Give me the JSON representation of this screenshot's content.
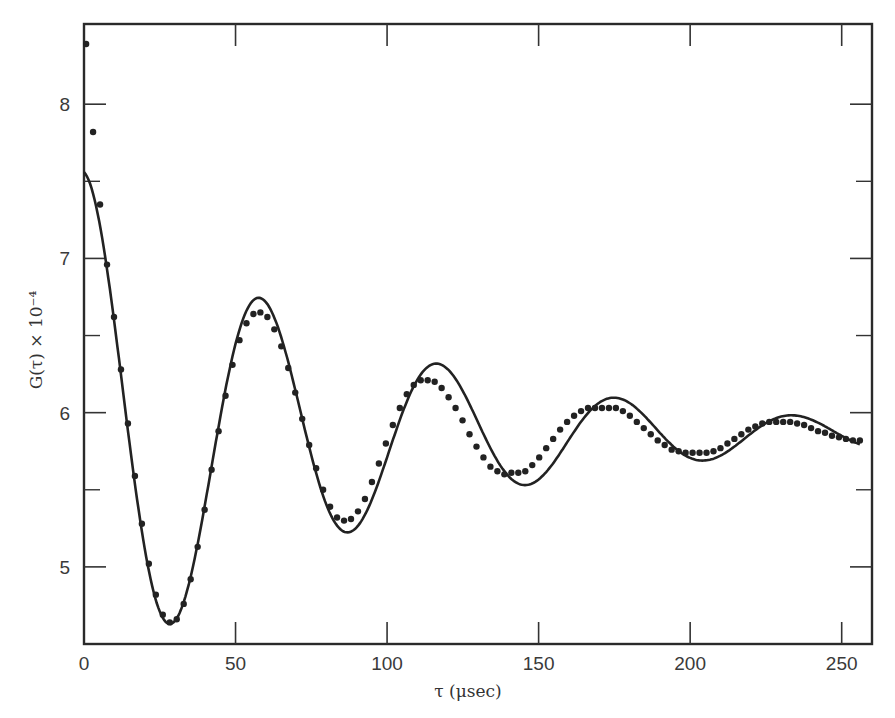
{
  "chart_data": {
    "type": "scatter",
    "title": "",
    "xlabel": "τ (μsec)",
    "ylabel": "G(τ) × 10⁻⁴",
    "xlim": [
      0,
      260
    ],
    "ylim": [
      4.5,
      8.52
    ],
    "grid": false,
    "legend": null,
    "x_ticks": [
      0,
      50,
      100,
      150,
      200,
      250
    ],
    "y_ticks": [
      5,
      6,
      7,
      8
    ],
    "y_minor_ticks": [
      4.5,
      5.5,
      6.5,
      7.5
    ],
    "outlier_points": [
      {
        "x": 0.7,
        "y": 8.39
      },
      {
        "x": 3.0,
        "y": 7.82
      },
      {
        "x": 5.3,
        "y": 7.35
      }
    ],
    "fit_curve": {
      "description": "damped cosine fit",
      "baseline": 5.86,
      "amplitude": 1.7,
      "decay_time": 89,
      "period": 58.6,
      "start": {
        "x": 0,
        "y": 7.56
      },
      "key_points": [
        {
          "x": 0,
          "y": 7.56,
          "kind": "start"
        },
        {
          "x": 28.4,
          "y": 4.63,
          "kind": "min"
        },
        {
          "x": 57.4,
          "y": 6.65,
          "kind": "max"
        },
        {
          "x": 86.8,
          "y": 5.31,
          "kind": "min"
        },
        {
          "x": 115.5,
          "y": 6.2,
          "kind": "max"
        },
        {
          "x": 145.0,
          "y": 5.61,
          "kind": "min"
        },
        {
          "x": 175.0,
          "y": 6.03,
          "kind": "max"
        },
        {
          "x": 205.6,
          "y": 5.74,
          "kind": "min"
        },
        {
          "x": 232.7,
          "y": 5.94,
          "kind": "max"
        },
        {
          "x": 256.0,
          "y": 5.82,
          "kind": "end"
        }
      ]
    },
    "series": [
      {
        "name": "measured G(τ)",
        "marker": "dot",
        "x": [
          7.6,
          9.9,
          12.2,
          14.5,
          16.8,
          19.1,
          21.4,
          23.7,
          26.0,
          28.3,
          30.6,
          32.9,
          35.2,
          37.5,
          39.8,
          42.1,
          44.4,
          46.7,
          49.0,
          51.3,
          53.6,
          55.9,
          58.2,
          60.5,
          62.8,
          65.1,
          67.4,
          69.7,
          72.0,
          74.3,
          76.6,
          78.9,
          81.2,
          83.5,
          85.8,
          88.1,
          90.4,
          92.7,
          95.0,
          97.3,
          99.6,
          101.9,
          104.2,
          106.5,
          108.8,
          111.1,
          113.4,
          115.7,
          118.0,
          120.3,
          122.6,
          124.9,
          127.2,
          129.5,
          131.8,
          134.1,
          136.4,
          138.7,
          141.0,
          143.3,
          145.6,
          147.9,
          150.2,
          152.5,
          154.8,
          157.1,
          159.4,
          161.7,
          164.0,
          166.3,
          168.6,
          170.9,
          173.2,
          175.5,
          177.8,
          180.1,
          182.4,
          184.7,
          187.0,
          189.3,
          191.6,
          193.9,
          196.2,
          198.5,
          200.8,
          203.1,
          205.4,
          207.7,
          210.0,
          212.3,
          214.6,
          216.9,
          219.2,
          221.5,
          223.8,
          226.1,
          228.4,
          230.7,
          233.0,
          235.3,
          237.6,
          239.9,
          242.2,
          244.5,
          246.8,
          249.1,
          251.4,
          253.7,
          256.0
        ],
        "y": [
          6.96,
          6.62,
          6.28,
          5.93,
          5.59,
          5.28,
          5.02,
          4.82,
          4.69,
          4.64,
          4.66,
          4.76,
          4.92,
          5.13,
          5.37,
          5.63,
          5.88,
          6.11,
          6.31,
          6.47,
          6.58,
          6.64,
          6.65,
          6.62,
          6.54,
          6.43,
          6.29,
          6.13,
          5.96,
          5.79,
          5.64,
          5.5,
          5.39,
          5.32,
          5.3,
          5.31,
          5.36,
          5.44,
          5.55,
          5.67,
          5.8,
          5.92,
          6.03,
          6.12,
          6.18,
          6.21,
          6.21,
          6.2,
          6.16,
          6.1,
          6.03,
          5.95,
          5.86,
          5.78,
          5.71,
          5.65,
          5.62,
          5.6,
          5.61,
          5.61,
          5.62,
          5.66,
          5.71,
          5.77,
          5.83,
          5.89,
          5.94,
          5.98,
          6.01,
          6.03,
          6.03,
          6.03,
          6.03,
          6.03,
          6.01,
          5.98,
          5.94,
          5.9,
          5.86,
          5.82,
          5.79,
          5.76,
          5.75,
          5.74,
          5.74,
          5.74,
          5.74,
          5.75,
          5.77,
          5.8,
          5.83,
          5.86,
          5.89,
          5.91,
          5.93,
          5.94,
          5.94,
          5.94,
          5.94,
          5.93,
          5.92,
          5.9,
          5.88,
          5.87,
          5.85,
          5.84,
          5.83,
          5.82,
          5.82
        ]
      }
    ]
  }
}
